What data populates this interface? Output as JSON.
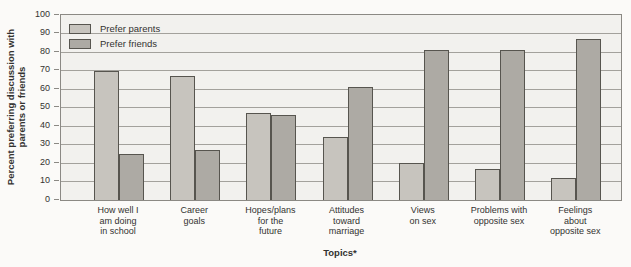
{
  "chart_data": {
    "type": "bar",
    "title": "",
    "xlabel": "Topics*",
    "ylabel_lines": [
      "Percent preferring discussion with",
      "parents or friends"
    ],
    "ylim": [
      0,
      100
    ],
    "yticks": [
      0,
      10,
      20,
      30,
      40,
      50,
      60,
      70,
      80,
      90,
      100
    ],
    "grid": "horizontal",
    "legend_position": "top-left-inside",
    "categories": [
      [
        "How well I",
        "am doing",
        "in school"
      ],
      [
        "Career",
        "goals"
      ],
      [
        "Hopes/plans",
        "for the",
        "future"
      ],
      [
        "Attitudes",
        "toward",
        "marriage"
      ],
      [
        "Views",
        "on sex"
      ],
      [
        "Problems with",
        "opposite sex"
      ],
      [
        "Feelings",
        "about",
        "opposite sex"
      ]
    ],
    "series": [
      {
        "name": "Prefer parents",
        "values": [
          70,
          67,
          47,
          34,
          20,
          17,
          12
        ],
        "color": "#c7c4be"
      },
      {
        "name": "Prefer friends",
        "values": [
          25,
          27,
          46,
          61,
          81,
          81,
          87
        ],
        "color": "#adaaa4"
      }
    ],
    "colors": {
      "page_bg": "#fbfaf8",
      "plot_bg": "#f2f1ee",
      "grid": "#a3a19c",
      "axis_box": "#8b8984",
      "bar_border": "#57554f",
      "text": "#333230"
    }
  }
}
